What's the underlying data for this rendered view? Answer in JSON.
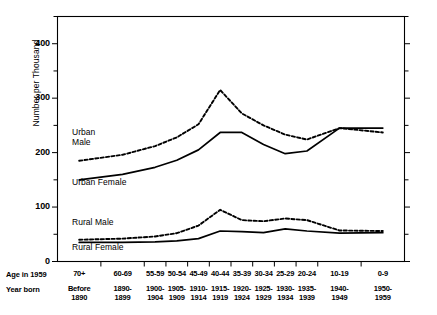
{
  "chart_data": {
    "type": "line",
    "title": "",
    "xlabel": "",
    "ylabel": "Number per Thousand",
    "ylim": [
      0,
      450
    ],
    "yticks_major": [
      0,
      100,
      200,
      300,
      400
    ],
    "yticks_minor": [
      50,
      150,
      250,
      350,
      450
    ],
    "grid": false,
    "legend": "inline-labels",
    "axis_rows": [
      {
        "header": "Age in 1959",
        "key": "age"
      },
      {
        "header": "Year born",
        "key": "born"
      }
    ],
    "categories": [
      {
        "age": "70+",
        "born": "Before 1890",
        "born_line1": "Before",
        "born_line2": "1890",
        "width": 2
      },
      {
        "age": "60-69",
        "born": "1890-1899",
        "born_line1": "1890-",
        "born_line2": "1899",
        "width": 2
      },
      {
        "age": "55-59",
        "born": "1900-1904",
        "born_line1": "1900-",
        "born_line2": "1904",
        "width": 1
      },
      {
        "age": "50-54",
        "born": "1905-1909",
        "born_line1": "1905-",
        "born_line2": "1909",
        "width": 1
      },
      {
        "age": "45-49",
        "born": "1910-1914",
        "born_line1": "1910-",
        "born_line2": "1914",
        "width": 1
      },
      {
        "age": "40-44",
        "born": "1915-1919",
        "born_line1": "1915-",
        "born_line2": "1919",
        "width": 1
      },
      {
        "age": "35-39",
        "born": "1920-1924",
        "born_line1": "1920-",
        "born_line2": "1924",
        "width": 1
      },
      {
        "age": "30-34",
        "born": "1925-1929",
        "born_line1": "1925-",
        "born_line2": "1929",
        "width": 1
      },
      {
        "age": "25-29",
        "born": "1930-1934",
        "born_line1": "1930-",
        "born_line2": "1934",
        "width": 1
      },
      {
        "age": "20-24",
        "born": "1935-1939",
        "born_line1": "1935-",
        "born_line2": "1939",
        "width": 1
      },
      {
        "age": "10-19",
        "born": "1940-1949",
        "born_line1": "1940-",
        "born_line2": "1949",
        "width": 2
      },
      {
        "age": "0-9",
        "born": "1950-1959",
        "born_line1": "1950-",
        "born_line2": "1959",
        "width": 2
      }
    ],
    "series": [
      {
        "name": "Urban Male",
        "style": "dashed",
        "label_line1": "Urban",
        "label_line2": "Male",
        "values": [
          185,
          196,
          212,
          228,
          252,
          315,
          272,
          250,
          233,
          224,
          245,
          237
        ]
      },
      {
        "name": "Urban Female",
        "style": "solid",
        "label_line1": "Urban Female",
        "label_line2": "",
        "values": [
          150,
          160,
          173,
          186,
          205,
          237,
          237,
          215,
          198,
          203,
          245,
          245
        ]
      },
      {
        "name": "Rural Male",
        "style": "dashed",
        "label_line1": "Rural Male",
        "label_line2": "",
        "values": [
          40,
          42,
          46,
          52,
          66,
          95,
          76,
          74,
          79,
          76,
          57,
          56
        ]
      },
      {
        "name": "Rural Female",
        "style": "solid",
        "label_line1": "Rural Female",
        "label_line2": "",
        "values": [
          35,
          35,
          36,
          38,
          42,
          56,
          55,
          53,
          60,
          56,
          52,
          53
        ]
      }
    ]
  }
}
